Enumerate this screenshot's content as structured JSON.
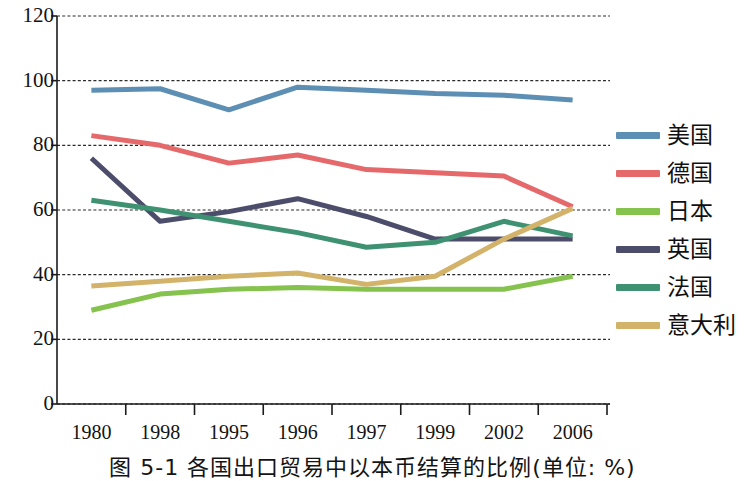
{
  "figure": {
    "caption": "图 5-1  各国出口贸易中以本币结算的比例(单位: %)"
  },
  "chart_data": {
    "type": "line",
    "title": "",
    "xlabel": "",
    "ylabel": "",
    "ylim": [
      0,
      120
    ],
    "ytick_step": 20,
    "yticks": [
      "0",
      "20",
      "40",
      "60",
      "80",
      "100",
      "120"
    ],
    "grid": true,
    "grid_style": "dashed-horizontal",
    "legend_position": "right",
    "categories": [
      "1980",
      "1998",
      "1995",
      "1996",
      "1997",
      "1999",
      "2002",
      "2006"
    ],
    "series": [
      {
        "name": "美国",
        "color": "#5D8FB4",
        "values": [
          97,
          97.5,
          91,
          98,
          97,
          96,
          95.5,
          94
        ]
      },
      {
        "name": "德国",
        "color": "#E5696B",
        "values": [
          83,
          80,
          74.5,
          77,
          72.5,
          71.5,
          70.5,
          61
        ]
      },
      {
        "name": "日本",
        "color": "#85C24E",
        "values": [
          29,
          34,
          35.5,
          36,
          35.5,
          35.5,
          35.5,
          39.5
        ]
      },
      {
        "name": "英国",
        "color": "#4C4C6B",
        "values": [
          76,
          56.5,
          59.5,
          63.5,
          58,
          51,
          51,
          51
        ]
      },
      {
        "name": "法国",
        "color": "#3E9272",
        "values": [
          63,
          60,
          56.5,
          53,
          48.5,
          50,
          56.5,
          52
        ]
      },
      {
        "name": "意大利",
        "color": "#D3B269",
        "values": [
          36.5,
          38,
          39.5,
          40.5,
          37,
          39.5,
          51,
          60.5
        ]
      }
    ]
  }
}
